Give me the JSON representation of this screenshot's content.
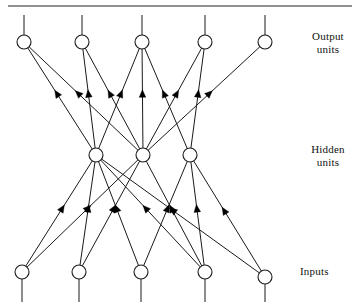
{
  "figure": {
    "background": "#ffffff",
    "stroke_color": "#1a1a1a",
    "node_fill": "#ffffff",
    "arrow_color": "#000000",
    "width": 358,
    "height": 308,
    "top_rule": {
      "y": 6,
      "x1": 8,
      "x2": 352,
      "color": "#6b6b6b",
      "thickness": 1.4
    }
  },
  "labels": {
    "output": "Output\nunits",
    "hidden": "Hidden\nunits",
    "inputs": "Inputs"
  },
  "diagram_data": {
    "type": "node-link-diagram",
    "node_radius": 7,
    "layers": [
      {
        "name": "output",
        "y": 42,
        "count": 5,
        "nodes": [
          {
            "id": "o1",
            "x": 24,
            "y": 42
          },
          {
            "id": "o2",
            "x": 82,
            "y": 42
          },
          {
            "id": "o3",
            "x": 142,
            "y": 42
          },
          {
            "id": "o4",
            "x": 205,
            "y": 42
          },
          {
            "id": "o5",
            "x": 265,
            "y": 42
          }
        ],
        "stems": {
          "direction": "up",
          "to_y": 15
        }
      },
      {
        "name": "hidden",
        "y": 155,
        "count": 3,
        "nodes": [
          {
            "id": "h1",
            "x": 96,
            "y": 155
          },
          {
            "id": "h2",
            "x": 143,
            "y": 155
          },
          {
            "id": "h3",
            "x": 190,
            "y": 155
          }
        ],
        "stems": null
      },
      {
        "name": "input",
        "y": 274,
        "count": 5,
        "nodes": [
          {
            "id": "i1",
            "x": 22,
            "y": 272
          },
          {
            "id": "i2",
            "x": 79,
            "y": 272
          },
          {
            "id": "i3",
            "x": 141,
            "y": 272
          },
          {
            "id": "i4",
            "x": 205,
            "y": 272
          },
          {
            "id": "i5",
            "x": 265,
            "y": 277
          }
        ],
        "stems": {
          "direction": "down",
          "to_y": 302
        }
      }
    ],
    "edges": [
      {
        "from": "h1",
        "to": "o1",
        "arrow_t": 0.55
      },
      {
        "from": "h2",
        "to": "o1",
        "arrow_t": 0.55
      },
      {
        "from": "h1",
        "to": "o2",
        "arrow_t": 0.55
      },
      {
        "from": "h2",
        "to": "o2",
        "arrow_t": 0.55
      },
      {
        "from": "h1",
        "to": "o3",
        "arrow_t": 0.55
      },
      {
        "from": "h2",
        "to": "o3",
        "arrow_t": 0.55
      },
      {
        "from": "h3",
        "to": "o3",
        "arrow_t": 0.55
      },
      {
        "from": "h2",
        "to": "o4",
        "arrow_t": 0.55
      },
      {
        "from": "h3",
        "to": "o4",
        "arrow_t": 0.55
      },
      {
        "from": "h2",
        "to": "o5",
        "arrow_t": 0.55
      },
      {
        "from": "i1",
        "to": "h1",
        "arrow_t": 0.55
      },
      {
        "from": "i1",
        "to": "h2",
        "arrow_t": 0.55
      },
      {
        "from": "i2",
        "to": "h1",
        "arrow_t": 0.55
      },
      {
        "from": "i2",
        "to": "h2",
        "arrow_t": 0.55
      },
      {
        "from": "i3",
        "to": "h1",
        "arrow_t": 0.55
      },
      {
        "from": "i3",
        "to": "h3",
        "arrow_t": 0.55
      },
      {
        "from": "i4",
        "to": "h1",
        "arrow_t": 0.55
      },
      {
        "from": "i4",
        "to": "h2",
        "arrow_t": 0.55
      },
      {
        "from": "i4",
        "to": "h3",
        "arrow_t": 0.55
      },
      {
        "from": "i5",
        "to": "h1",
        "arrow_t": 0.55
      },
      {
        "from": "i5",
        "to": "h3",
        "arrow_t": 0.55
      }
    ]
  }
}
